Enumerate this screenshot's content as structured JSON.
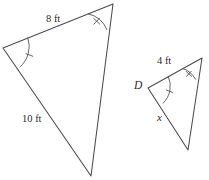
{
  "figure": {
    "background_color": "#ffffff",
    "stroke_color": "#4a4a4a",
    "text_color": "#2b2b2b"
  },
  "large_triangle": {
    "name": "large-triangle",
    "vertices": {
      "top_right": {
        "x": 113,
        "y": 4
      },
      "left": {
        "x": 3,
        "y": 48
      },
      "bottom": {
        "x": 91,
        "y": 176
      }
    },
    "labels": {
      "top_side": "8 ft",
      "left_side": "10 ft"
    },
    "angle_marks": {
      "left": "single-tick-arc",
      "top_right": "double-tick-arc"
    }
  },
  "small_triangle": {
    "name": "small-triangle",
    "vertices": {
      "top_right": {
        "x": 202,
        "y": 58
      },
      "left": {
        "x": 148,
        "y": 88
      },
      "bottom": {
        "x": 188,
        "y": 150
      }
    },
    "labels": {
      "top_side": "4 ft",
      "vertex_left": "D",
      "lower_left_side": "x"
    },
    "angle_marks": {
      "left": "single-tick-arc",
      "top_right": "double-tick-arc"
    }
  }
}
